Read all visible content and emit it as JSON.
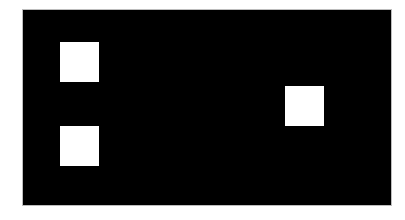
{
  "canvas": {
    "width": 405,
    "height": 220,
    "background_color": "#ffffff"
  },
  "panel": {
    "x": 23,
    "y": 10,
    "width": 368,
    "height": 195,
    "color": "#000000",
    "border_color": "#bdbdbd"
  },
  "squares": [
    {
      "id": "top-left",
      "x": 60,
      "y": 42,
      "width": 39,
      "height": 40,
      "color": "#ffffff"
    },
    {
      "id": "bottom-left",
      "x": 60,
      "y": 126,
      "width": 39,
      "height": 40,
      "color": "#ffffff"
    },
    {
      "id": "right",
      "x": 285,
      "y": 86,
      "width": 39,
      "height": 40,
      "color": "#ffffff"
    }
  ]
}
